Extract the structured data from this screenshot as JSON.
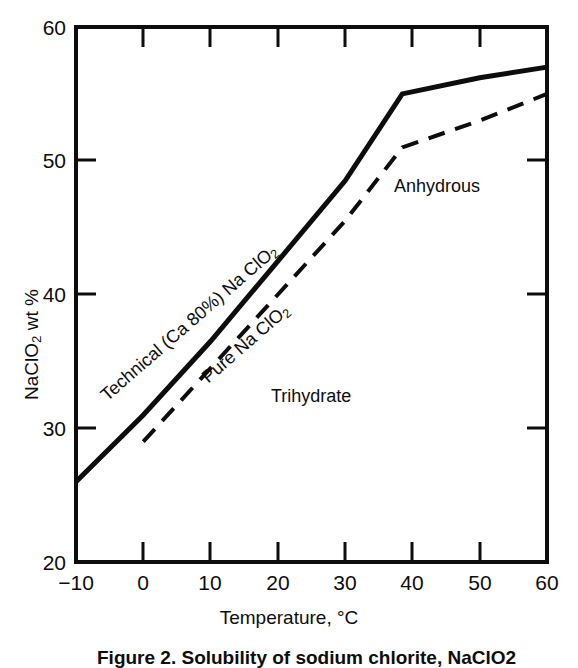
{
  "figure": {
    "caption": "Figure 2.   Solubility of sodium chlorite, NaClO2",
    "background_color": "#ffffff",
    "ink_color": "#0d0d0d"
  },
  "chart_data": {
    "type": "line",
    "title": "",
    "xlabel": "Temperature, °C",
    "ylabel": "NaClO2  wt %",
    "ylabel_parts": {
      "pre": "NaClO",
      "sub": "2",
      "post": "  wt %"
    },
    "xlim": [
      -10,
      60
    ],
    "ylim": [
      20,
      60
    ],
    "xticks": [
      -10,
      0,
      10,
      20,
      30,
      40,
      50,
      60
    ],
    "xtick_labels": [
      "−10",
      "0",
      "10",
      "20",
      "30",
      "40",
      "50",
      "60"
    ],
    "yticks": [
      20,
      30,
      40,
      50,
      60
    ],
    "ytick_labels": [
      "20",
      "30",
      "40",
      "50",
      "60"
    ],
    "grid": false,
    "legend": "inline-curve-labels",
    "tick_direction": "in",
    "frame": "box",
    "series": [
      {
        "name": "Technical (Ca 80%) Na ClO2",
        "style": "solid",
        "label_parts": {
          "pre": "Technical (Ca 80%) Na ClO",
          "sub": "2",
          "post": ""
        },
        "points": [
          {
            "x": -10,
            "y": 26.0
          },
          {
            "x": 0,
            "y": 31.0
          },
          {
            "x": 10,
            "y": 36.5
          },
          {
            "x": 20,
            "y": 42.5
          },
          {
            "x": 30,
            "y": 48.5
          },
          {
            "x": 38.5,
            "y": 55.0
          },
          {
            "x": 50,
            "y": 56.2
          },
          {
            "x": 60,
            "y": 57.0
          }
        ]
      },
      {
        "name": "Pure Na ClO2",
        "style": "dashed",
        "label_parts": {
          "pre": "Pure  Na ClO",
          "sub": "2",
          "post": ""
        },
        "points": [
          {
            "x": 0,
            "y": 29.0
          },
          {
            "x": 10,
            "y": 34.5
          },
          {
            "x": 20,
            "y": 40.0
          },
          {
            "x": 30,
            "y": 45.5
          },
          {
            "x": 38.5,
            "y": 51.0
          },
          {
            "x": 50,
            "y": 53.0
          },
          {
            "x": 60,
            "y": 55.0
          }
        ]
      }
    ],
    "region_labels": [
      {
        "text": "Anhydrous",
        "x": 43.5,
        "y": 47.0
      },
      {
        "text": "Trihydrate",
        "x": 30.0,
        "y": 32.0
      }
    ],
    "annotations": [
      {
        "text": "Technical (Ca 80%) Na ClO2",
        "kind": "curve-label",
        "series": 0
      },
      {
        "text": "Pure  Na ClO2",
        "kind": "curve-label",
        "series": 1
      }
    ]
  }
}
